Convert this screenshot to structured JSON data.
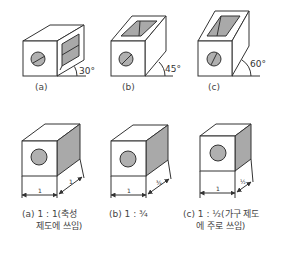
{
  "top_row": [
    {
      "label": "(a)",
      "angle": "30°"
    },
    {
      "label": "(b)",
      "angle": "45°"
    },
    {
      "label": "(c)",
      "angle": "60°"
    }
  ],
  "bottom_row": [
    {
      "front_dim": "1",
      "depth_dim": "1",
      "caption_line1": "(a) 1 : 1(축성",
      "caption_line2": "제도에 쓰임)"
    },
    {
      "front_dim": "1",
      "depth_dim": "¾",
      "caption_line1": "(b) 1 : ¾",
      "caption_line2": ""
    },
    {
      "front_dim": "1",
      "depth_dim": "½",
      "caption_line1": "(c) 1 : ½(가구 제도",
      "caption_line2": "에 주로 쓰임)"
    }
  ],
  "colors": {
    "line": "#333333",
    "shade": "#a9a9a9",
    "background": "#ffffff"
  }
}
